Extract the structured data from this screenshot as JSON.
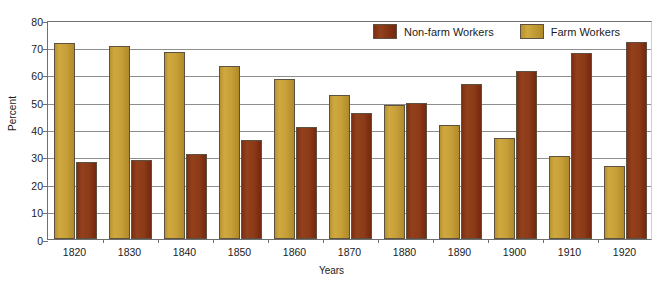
{
  "chart_data": {
    "type": "bar",
    "title": "",
    "xlabel": "Years",
    "ylabel": "Percent",
    "ylim": [
      0,
      80
    ],
    "yticks": [
      0,
      10,
      20,
      30,
      40,
      50,
      60,
      70,
      80
    ],
    "grid": true,
    "legend_position": "top-right",
    "categories": [
      "1820",
      "1830",
      "1840",
      "1850",
      "1860",
      "1870",
      "1880",
      "1890",
      "1900",
      "1910",
      "1920"
    ],
    "series": [
      {
        "name": "Farm Workers",
        "color": "#C79F38",
        "values": [
          71.5,
          70.5,
          68.2,
          63.2,
          58.3,
          52.5,
          48.8,
          41.5,
          37.0,
          30.5,
          26.5
        ]
      },
      {
        "name": "Non-farm Workers",
        "color": "#8C3A17",
        "values": [
          28.0,
          29.0,
          31.0,
          36.0,
          40.8,
          46.0,
          49.8,
          56.5,
          61.3,
          67.8,
          72.0
        ]
      }
    ]
  },
  "legend": {
    "items": [
      {
        "label": "Non-farm Workers",
        "series": "Non-farm Workers",
        "color": "#8C3A17"
      },
      {
        "label": "Farm Workers",
        "series": "Farm Workers",
        "color": "#C79F38"
      }
    ]
  },
  "axes": {
    "y_title": "Percent",
    "x_title": "Years"
  }
}
